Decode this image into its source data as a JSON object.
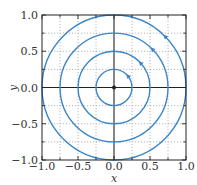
{
  "chart_data": {
    "type": "line",
    "title": "",
    "xlabel": "x",
    "ylabel": "y",
    "xlim": [
      -1.0,
      1.0
    ],
    "ylim": [
      -1.0,
      1.0
    ],
    "grid": true,
    "grid_style": "dotted",
    "grid_step": 0.25,
    "xticks": [
      "-1.0",
      "-0.5",
      "0.0",
      "0.5",
      "1.0"
    ],
    "yticks": [
      "-1.0",
      "-0.5",
      "0.0",
      "0.5",
      "1.0"
    ],
    "legend": null,
    "series": [
      {
        "name": "circle r=0.25",
        "shape": "circle",
        "center": [
          0,
          0
        ],
        "radius": 0.25,
        "arrow_at_angle_deg": 40,
        "direction": "counterclockwise"
      },
      {
        "name": "circle r=0.5",
        "shape": "circle",
        "center": [
          0,
          0
        ],
        "radius": 0.5,
        "arrow_at_angle_deg": 43,
        "direction": "counterclockwise"
      },
      {
        "name": "circle r=0.75",
        "shape": "circle",
        "center": [
          0,
          0
        ],
        "radius": 0.75,
        "arrow_at_angle_deg": 45,
        "direction": "counterclockwise"
      },
      {
        "name": "circle r=1.0",
        "shape": "circle",
        "center": [
          0,
          0
        ],
        "radius": 1.0,
        "arrow_at_angle_deg": 45,
        "direction": "counterclockwise"
      }
    ],
    "annotations": [
      {
        "type": "point",
        "x": 0.0,
        "y": 0.0,
        "label": "origin / equilibrium"
      }
    ],
    "colors": {
      "curves": "#3a86c8",
      "axes": "#222222",
      "grid": "#9a9a9a"
    }
  }
}
